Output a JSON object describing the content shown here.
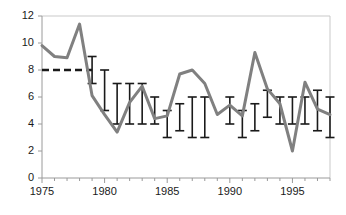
{
  "chart_data": {
    "type": "line",
    "title": "",
    "subtitle": "",
    "xlabel": "",
    "ylabel": "",
    "xlim": [
      1975,
      1998
    ],
    "ylim": [
      0,
      12
    ],
    "grid": false,
    "legend": null,
    "x_ticks": [
      1975,
      1980,
      1985,
      1990,
      1995
    ],
    "x_tick_labels": [
      "1975",
      "1980",
      "1985",
      "1990",
      "1995"
    ],
    "x_minor_ticks": [
      1976,
      1977,
      1978,
      1979,
      1981,
      1982,
      1983,
      1984,
      1986,
      1987,
      1988,
      1989,
      1991,
      1992,
      1993,
      1994,
      1996,
      1997,
      1998
    ],
    "y_ticks": [
      0,
      2,
      4,
      6,
      8,
      10,
      12
    ],
    "y_tick_labels": [
      "0",
      "2",
      "4",
      "6",
      "8",
      "10",
      "12"
    ],
    "series": [
      {
        "name": "observed",
        "style": "line",
        "color": "#808080",
        "linewidth": 3,
        "x": [
          1975,
          1976,
          1977,
          1978,
          1979,
          1980,
          1981,
          1982,
          1983,
          1984,
          1985,
          1986,
          1987,
          1988,
          1989,
          1990,
          1991,
          1992,
          1993,
          1994,
          1995,
          1996,
          1997,
          1998
        ],
        "values": [
          9.8,
          9.0,
          8.9,
          11.4,
          6.1,
          4.7,
          3.4,
          5.6,
          6.8,
          4.4,
          4.6,
          7.7,
          8.0,
          7.0,
          4.7,
          5.4,
          4.6,
          9.3,
          6.6,
          5.5,
          2.0,
          7.1,
          5.1,
          4.7
        ]
      },
      {
        "name": "reference-level",
        "style": "dashed-line",
        "color": "#1a1a1a",
        "y": 8.0,
        "x_start": 1975,
        "x_end": 1979
      }
    ],
    "error_bars": {
      "color": "#1a1a1a",
      "points": [
        {
          "x": 1979,
          "low": 7.0,
          "high": 9.0
        },
        {
          "x": 1980,
          "low": 5.0,
          "high": 8.0
        },
        {
          "x": 1981,
          "low": 4.0,
          "high": 7.0
        },
        {
          "x": 1982,
          "low": 4.0,
          "high": 7.0
        },
        {
          "x": 1983,
          "low": 4.0,
          "high": 7.0
        },
        {
          "x": 1984,
          "low": 4.0,
          "high": 6.0
        },
        {
          "x": 1985,
          "low": 3.0,
          "high": 5.0
        },
        {
          "x": 1986,
          "low": 3.5,
          "high": 5.5
        },
        {
          "x": 1987,
          "low": 3.0,
          "high": 6.0
        },
        {
          "x": 1988,
          "low": 3.0,
          "high": 6.0
        },
        {
          "x": 1990,
          "low": 4.0,
          "high": 6.0
        },
        {
          "x": 1991,
          "low": 3.0,
          "high": 5.0
        },
        {
          "x": 1992,
          "low": 3.5,
          "high": 5.5
        },
        {
          "x": 1993,
          "low": 4.5,
          "high": 6.5
        },
        {
          "x": 1994,
          "low": 4.0,
          "high": 6.0
        },
        {
          "x": 1995,
          "low": 4.0,
          "high": 6.0
        },
        {
          "x": 1996,
          "low": 4.0,
          "high": 6.0
        },
        {
          "x": 1997,
          "low": 3.5,
          "high": 6.5
        },
        {
          "x": 1998,
          "low": 3.0,
          "high": 6.0
        }
      ]
    }
  }
}
